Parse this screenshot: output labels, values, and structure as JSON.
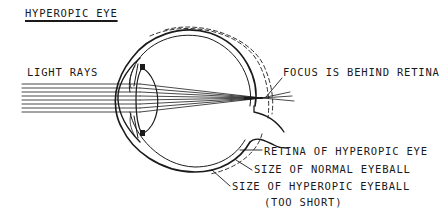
{
  "title": "HYPEROPIC EYE",
  "labels": {
    "light_rays": "LIGHT RAYS",
    "focus": "FOCUS IS BEHIND RETINA",
    "retina": "RETINA OF HYPEROPIC EYE",
    "normal_size": "SIZE OF NORMAL EYEBALL",
    "hyperopic_size": "SIZE OF HYPEROPIC EYEBALL",
    "too_short": "(TOO SHORT)"
  },
  "colors": {
    "ink": "#1a1a1a",
    "background": "#ffffff"
  }
}
